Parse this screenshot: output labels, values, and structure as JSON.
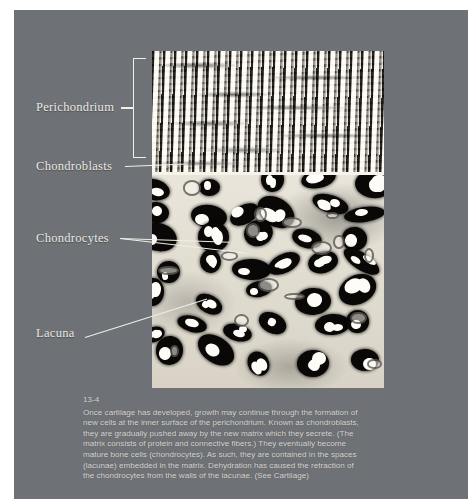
{
  "figure": {
    "number": "13-4",
    "plate_background": "#6e7175",
    "label_color": "#eceae4",
    "caption_color": "#d9d7d2"
  },
  "labels": [
    {
      "id": "perichondrium",
      "text": "Perichondrium",
      "marker": "bracket"
    },
    {
      "id": "chondroblasts",
      "text": "Chondroblasts",
      "marker": "leader-line"
    },
    {
      "id": "chondrocytes",
      "text": "Chondrocytes",
      "marker": "leader-line-pair"
    },
    {
      "id": "lacuna",
      "text": "Lacuna",
      "marker": "leader-line"
    }
  ],
  "micrograph": {
    "alt": "light micrograph of hyaline cartilage showing perichondrium, chondroblasts, chondrocytes and lacunae",
    "regions": [
      {
        "name": "perichondrium",
        "description": "dense wavy fibrous lamellae"
      },
      {
        "name": "cartilage-matrix",
        "description": "pale matrix with dark lacunae containing bright chondrocytes"
      }
    ]
  },
  "caption": {
    "number": "13-4",
    "lines": [
      "Once cartilage has developed, growth may continue through the formation of",
      "new cells at the inner surface of the perichondrium. Known as chondroblasts,",
      "they are gradually pushed away by the new matrix which they secrete. (The",
      "matrix consists of protein and connective fibers.) They eventually become",
      "mature bone cells (chondrocytes). As such, they are contained in the spaces",
      "(lacunae) embedded in the matrix. Dehydration has caused the retraction of",
      "the chondrocytes from the walls of the lacunae. (See Cartilage)"
    ]
  }
}
